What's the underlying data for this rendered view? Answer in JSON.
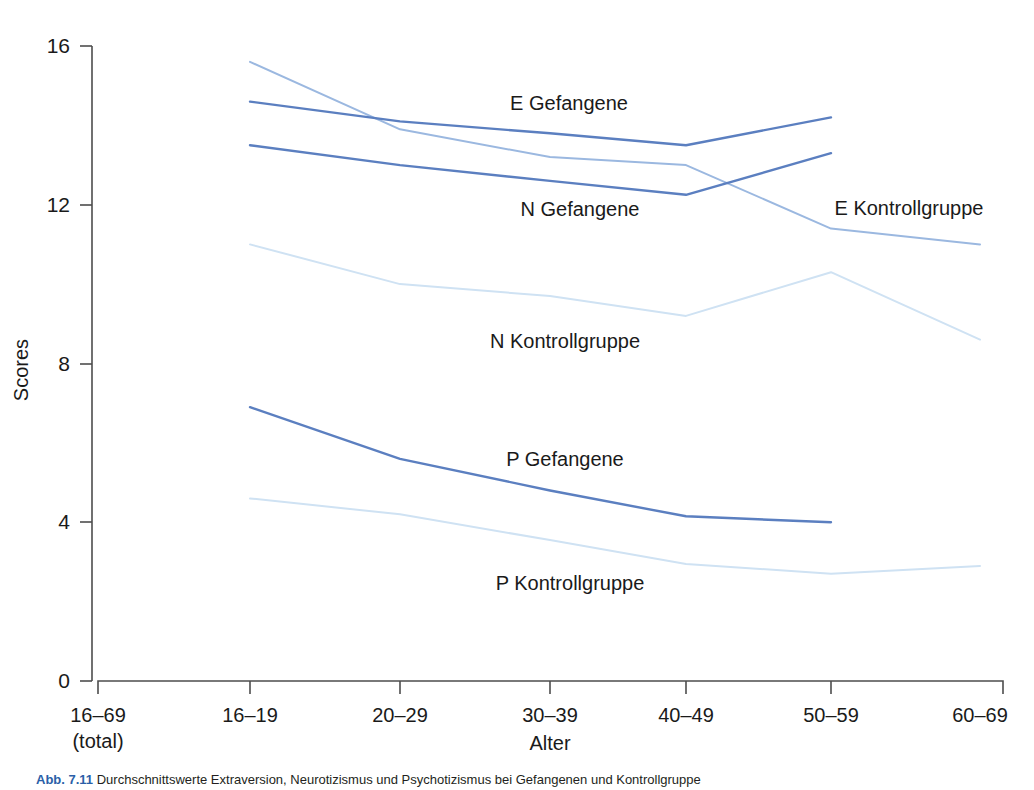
{
  "figure": {
    "caption_number": "Abb. 7.11",
    "caption_text": "Durchschnittswerte Extraversion, Neurotizismus und Psychotizismus bei Gefangenen und Kontrollgruppe"
  },
  "axes": {
    "y_title": "Scores",
    "x_title": "Alter",
    "y_ticks": [
      "16",
      "12",
      "8",
      "4",
      "0"
    ],
    "y_tick_values": [
      16,
      12,
      8,
      4,
      0
    ],
    "x_ticks": [
      {
        "line1": "16–69",
        "line2": "(total)"
      },
      {
        "line1": "16–19",
        "line2": ""
      },
      {
        "line1": "20–29",
        "line2": ""
      },
      {
        "line1": "30–39",
        "line2": ""
      },
      {
        "line1": "40–49",
        "line2": ""
      },
      {
        "line1": "50–59",
        "line2": ""
      },
      {
        "line1": "60–69",
        "line2": ""
      }
    ]
  },
  "colors": {
    "dark_blue": "#5b7fc0",
    "mid_blue": "#9bb8e0",
    "light_blue": "#cfe2f3",
    "axis": "#4d4d4d",
    "text": "#1a1a1a",
    "caption_accent": "#2b5fa8"
  },
  "series_labels": [
    {
      "name": "e-gefangene-label",
      "text": "E Gefangene"
    },
    {
      "name": "n-gefangene-label",
      "text": "N Gefangene"
    },
    {
      "name": "e-kontrollgruppe-label",
      "text": "E Kontrollgruppe"
    },
    {
      "name": "n-kontrollgruppe-label",
      "text": "N Kontrollgruppe"
    },
    {
      "name": "p-gefangene-label",
      "text": "P Gefangene"
    },
    {
      "name": "p-kontrollgruppe-label",
      "text": "P Kontrollgruppe"
    }
  ],
  "chart_data": {
    "type": "line",
    "title": "",
    "xlabel": "Alter",
    "ylabel": "Scores",
    "ylim": [
      0,
      16
    ],
    "yticks": [
      0,
      4,
      8,
      12,
      16
    ],
    "grid": false,
    "legend": "inline-labels",
    "categories": [
      "16–69 (total)",
      "16–19",
      "20–29",
      "30–39",
      "40–49",
      "50–59",
      "60–69"
    ],
    "series": [
      {
        "name": "E Kontrollgruppe",
        "color": "#9bb8e0",
        "x": [
          "16–19",
          "20–29",
          "30–39",
          "40–49",
          "50–59",
          "60–69"
        ],
        "values": [
          15.6,
          13.9,
          13.2,
          13.0,
          11.4,
          11.0
        ]
      },
      {
        "name": "E Gefangene",
        "color": "#5b7fc0",
        "x": [
          "16–19",
          "20–29",
          "30–39",
          "40–49",
          "50–59"
        ],
        "values": [
          14.6,
          14.1,
          13.8,
          13.5,
          14.2
        ]
      },
      {
        "name": "N Gefangene",
        "color": "#5b7fc0",
        "x": [
          "16–19",
          "20–29",
          "30–39",
          "40–49",
          "50–59"
        ],
        "values": [
          13.5,
          13.0,
          12.6,
          12.25,
          13.3
        ]
      },
      {
        "name": "N Kontrollgruppe",
        "color": "#cfe2f3",
        "x": [
          "16–19",
          "20–29",
          "30–39",
          "40–49",
          "50–59",
          "60–69"
        ],
        "values": [
          11.0,
          10.0,
          9.7,
          9.2,
          10.3,
          8.6
        ]
      },
      {
        "name": "P Gefangene",
        "color": "#5b7fc0",
        "x": [
          "16–19",
          "20–29",
          "30–39",
          "40–49",
          "50–59"
        ],
        "values": [
          6.9,
          5.6,
          4.8,
          4.15,
          4.0
        ]
      },
      {
        "name": "P Kontrollgruppe",
        "color": "#cfe2f3",
        "x": [
          "16–19",
          "20–29",
          "30–39",
          "40–49",
          "50–59",
          "60–69"
        ],
        "values": [
          4.6,
          4.2,
          3.55,
          2.95,
          2.7,
          2.9
        ]
      }
    ]
  }
}
